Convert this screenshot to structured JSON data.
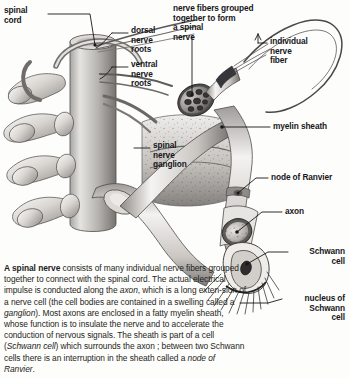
{
  "figure": {
    "type": "anatomical-illustration",
    "palette": {
      "background": "#fdfdfc",
      "ink": "#17171a",
      "tissue_light": "#f2f0ee",
      "tissue_mid": "#b9b7b4",
      "tissue_dark": "#6e6c6a",
      "outline": "#3a3a3c"
    },
    "labels": [
      {
        "name": "spinal-cord",
        "text": "spinal\ncord"
      },
      {
        "name": "dorsal-nerve-roots",
        "text": "dorsal\nnerve\nroots"
      },
      {
        "name": "ventral-nerve-roots",
        "text": "ventral\nnerve\nroots"
      },
      {
        "name": "nerve-fibers-grouped",
        "text": "nerve fibers grouped\ntogether to form\na spinal\nnerve"
      },
      {
        "name": "individual-nerve-fiber",
        "text": "individual\nnerve\nfiber"
      },
      {
        "name": "myelin-sheath",
        "text": "myelin sheath"
      },
      {
        "name": "spinal-nerve-ganglion",
        "text": "spinal\nnerve\nganglion"
      },
      {
        "name": "node-of-ranvier",
        "text": "node of Ranvier"
      },
      {
        "name": "axon",
        "text": "axon"
      },
      {
        "name": "schwann-cell",
        "text": "Schwann\ncell"
      },
      {
        "name": "nucleus-of-schwann-cell",
        "text": "nucleus of\nSchwann\ncell"
      }
    ]
  },
  "caption": {
    "lead": "A spinal nerve",
    "body_1": " consists of many individual nerve fibers grouped together to connect with the spinal cord. The actual electrical impulse is conducted along the ",
    "italic_1": "axon",
    "body_2": ", which is a long exten-sion of a nerve cell (the cell bodies are contained in a swelling called a ",
    "italic_2": "ganglion",
    "body_3": "). Most axons are enclosed in a fatty myelin sheath, whose function is to insulate the nerve and to accelerate the conduction of nervous signals. The sheath is part of a cell (",
    "italic_3": "Schwann cell",
    "body_4": ") which surrounds the axon ; between two Schwann cells there is an interruption in the sheath called a ",
    "italic_4": "node of Ranvier",
    "body_5": "."
  }
}
